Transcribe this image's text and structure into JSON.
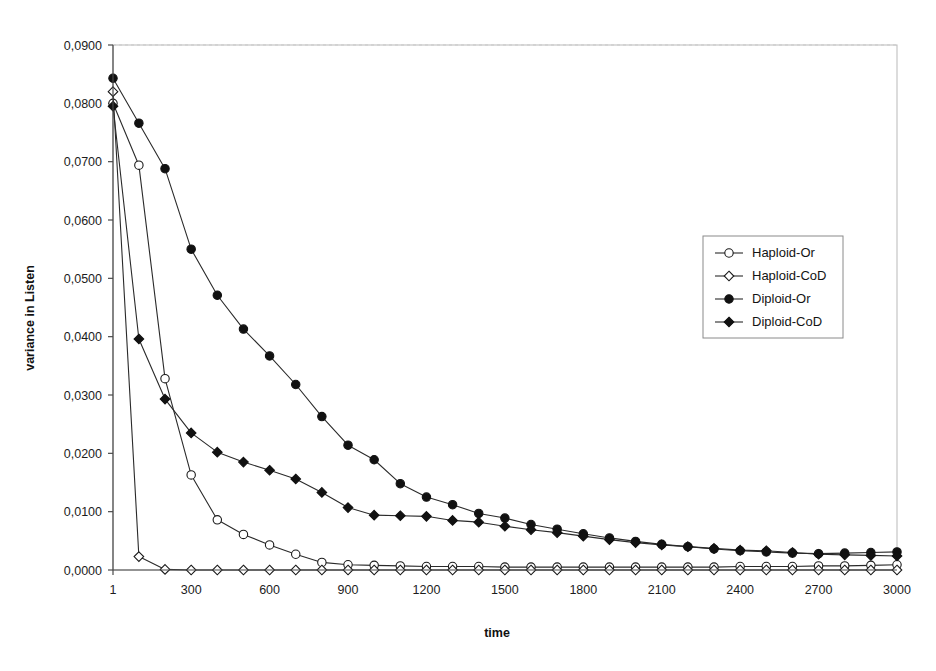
{
  "chart_data": {
    "type": "line",
    "title": "",
    "xlabel": "time",
    "ylabel": "variance in Listen",
    "xlim": [
      1,
      3000
    ],
    "ylim": [
      0.0,
      0.09
    ],
    "grid": false,
    "legend_position": "upper-right",
    "decimal_separator": ",",
    "x_tick_labels": [
      "1",
      "300",
      "600",
      "900",
      "1200",
      "1500",
      "1800",
      "2100",
      "2400",
      "2700",
      "3000"
    ],
    "x_tick_values": [
      1,
      300,
      600,
      900,
      1200,
      1500,
      1800,
      2100,
      2400,
      2700,
      3000
    ],
    "y_tick_labels": [
      "0,0000",
      "0,0100",
      "0,0200",
      "0,0300",
      "0,0400",
      "0,0500",
      "0,0600",
      "0,0700",
      "0,0800",
      "0,0900"
    ],
    "y_tick_values": [
      0.0,
      0.01,
      0.02,
      0.03,
      0.04,
      0.05,
      0.06,
      0.07,
      0.08,
      0.09
    ],
    "x": [
      1,
      100,
      200,
      300,
      400,
      500,
      600,
      700,
      800,
      900,
      1000,
      1100,
      1200,
      1300,
      1400,
      1500,
      1600,
      1700,
      1800,
      1900,
      2000,
      2100,
      2200,
      2300,
      2400,
      2500,
      2600,
      2700,
      2800,
      2900,
      3000
    ],
    "series": [
      {
        "name": "Haploid-Or",
        "marker": "open-circle",
        "values": [
          0.08,
          0.0694,
          0.0328,
          0.0163,
          0.0086,
          0.0061,
          0.0043,
          0.0027,
          0.0013,
          0.0009,
          0.0008,
          0.0007,
          0.0006,
          0.0006,
          0.0006,
          0.0005,
          0.0005,
          0.0005,
          0.0005,
          0.0005,
          0.0005,
          0.0005,
          0.0005,
          0.0005,
          0.0006,
          0.0006,
          0.0006,
          0.0007,
          0.0007,
          0.0008,
          0.0009
        ]
      },
      {
        "name": "Haploid-CoD",
        "marker": "open-diamond",
        "values": [
          0.082,
          0.0023,
          0.0001,
          0.0,
          0.0,
          0.0,
          0.0,
          0.0,
          0.0,
          0.0,
          0.0,
          0.0,
          0.0,
          0.0,
          0.0,
          0.0,
          0.0,
          0.0,
          0.0,
          0.0,
          0.0,
          0.0,
          0.0,
          0.0,
          0.0,
          0.0,
          0.0,
          0.0,
          0.0,
          0.0,
          0.0
        ]
      },
      {
        "name": "Diploid-Or",
        "marker": "filled-circle",
        "values": [
          0.0843,
          0.0766,
          0.0688,
          0.055,
          0.0471,
          0.0413,
          0.0367,
          0.0318,
          0.0263,
          0.0214,
          0.0189,
          0.0148,
          0.0125,
          0.0112,
          0.0097,
          0.0089,
          0.0078,
          0.007,
          0.0062,
          0.0055,
          0.0049,
          0.0044,
          0.004,
          0.0036,
          0.0033,
          0.0031,
          0.0029,
          0.0028,
          0.0029,
          0.003,
          0.0031
        ]
      },
      {
        "name": "Diploid-CoD",
        "marker": "filled-diamond",
        "values": [
          0.0795,
          0.0396,
          0.0293,
          0.0235,
          0.0202,
          0.0185,
          0.0171,
          0.0156,
          0.0133,
          0.0107,
          0.0094,
          0.0093,
          0.0092,
          0.0085,
          0.0082,
          0.0075,
          0.0069,
          0.0064,
          0.0058,
          0.0052,
          0.0047,
          0.0043,
          0.004,
          0.0037,
          0.0034,
          0.0033,
          0.003,
          0.0027,
          0.0026,
          0.0025,
          0.0024
        ]
      }
    ]
  },
  "legend": {
    "items": [
      {
        "label": "Haploid-Or",
        "marker": "open-circle"
      },
      {
        "label": "Haploid-CoD",
        "marker": "open-diamond"
      },
      {
        "label": "Diploid-Or",
        "marker": "filled-circle"
      },
      {
        "label": "Diploid-CoD",
        "marker": "filled-diamond"
      }
    ]
  },
  "axes": {
    "x_title": "time",
    "y_title": "variance in Listen"
  }
}
